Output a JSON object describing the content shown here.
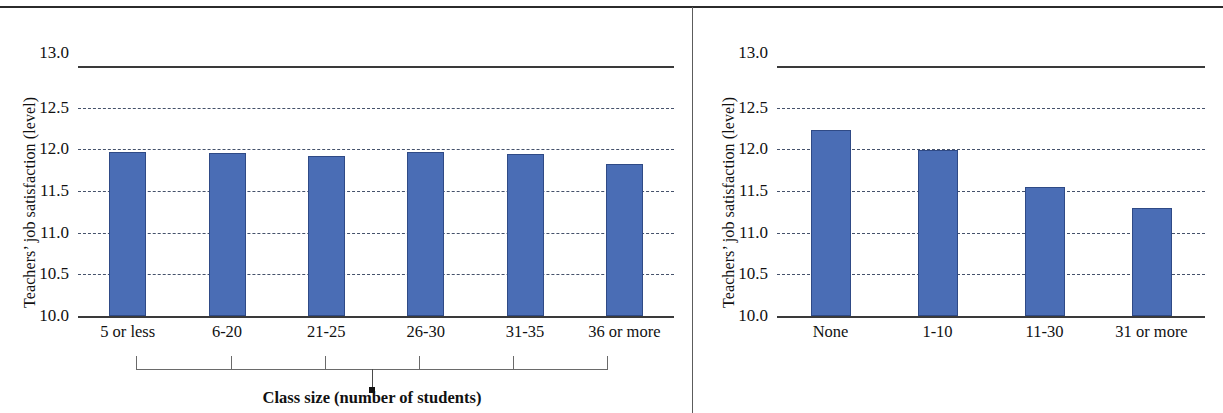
{
  "figure": {
    "ylabel": "Teachers’ job satisfaction (level)",
    "y_ticks": [
      "13.0",
      "12.5",
      "12.0",
      "11.5",
      "11.0",
      "10.5",
      "10.0"
    ],
    "bar_color": "#4a6db5",
    "bar_border_color": "#2f4a86",
    "gridline_color": "#45526b",
    "axis_color": "#3a3a3a"
  },
  "panels": [
    {
      "id": "class-size",
      "caption": "Class size (number of students)",
      "categories": [
        "5 or less",
        "6-20",
        "21-25",
        "26-30",
        "31-35",
        "36 or more"
      ],
      "values": [
        11.97,
        11.96,
        11.92,
        11.97,
        11.94,
        11.82
      ]
    },
    {
      "id": "behavioural-problems",
      "caption": "Students with behavioural problems (%)",
      "categories": [
        "None",
        "1-10",
        "11-30",
        "31 or more"
      ],
      "values": [
        12.23,
        11.99,
        11.55,
        11.3
      ]
    }
  ],
  "chart_data": [
    {
      "type": "bar",
      "title": "",
      "xlabel": "Class size (number of students)",
      "ylabel": "Teachers’ job satisfaction (level)",
      "categories": [
        "5 or less",
        "6-20",
        "21-25",
        "26-30",
        "31-35",
        "36 or more"
      ],
      "values": [
        11.97,
        11.96,
        11.92,
        11.97,
        11.94,
        11.82
      ],
      "ylim": [
        10.0,
        13.0
      ],
      "ytick_labels": [
        "10.0",
        "10.5",
        "11.0",
        "11.5",
        "12.0",
        "12.5",
        "13.0"
      ],
      "grid": "horizontal-dashed",
      "legend": "none",
      "series_color": "#4a6db5"
    },
    {
      "type": "bar",
      "title": "",
      "xlabel": "Students with behavioural problems (%)",
      "ylabel": "Teachers’ job satisfaction (level)",
      "categories": [
        "None",
        "1-10",
        "11-30",
        "31 or more"
      ],
      "values": [
        12.23,
        11.99,
        11.55,
        11.3
      ],
      "ylim": [
        10.0,
        13.0
      ],
      "ytick_labels": [
        "10.0",
        "10.5",
        "11.0",
        "11.5",
        "12.0",
        "12.5",
        "13.0"
      ],
      "grid": "horizontal-dashed",
      "legend": "none",
      "series_color": "#4a6db5"
    }
  ]
}
